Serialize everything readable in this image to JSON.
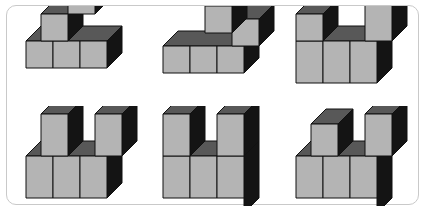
{
  "page": {
    "background_color": "#ffffff",
    "frame": {
      "border_color": "#c9c9c9",
      "corner_radius": "10px",
      "label": "puzzle-frame"
    }
  },
  "palette": {
    "cube_front": "#b4b4b4",
    "cube_top": "#585858",
    "cube_side": "#141414",
    "cube_edge": "#6e6e6e",
    "cube_top_edge": "#2a2a2a",
    "outline": "#111111"
  },
  "projection": {
    "type": "cabinet-oblique",
    "cube_face_px": 27,
    "depth_dx_px": 15,
    "depth_dy_px": -15
  },
  "figures": [
    {
      "id": "figure-1",
      "position": "top-left",
      "description": "Ascending three-step staircase",
      "cube_count": 6,
      "columns": [
        {
          "x": 0,
          "base_height": 1,
          "raised_cubes": 0
        },
        {
          "x": 1,
          "base_height": 1,
          "raised_cubes": 1
        },
        {
          "x": 2,
          "base_height": 1,
          "raised_cubes": 2
        }
      ],
      "cubes": [
        {
          "x": 0,
          "y": 0,
          "z": 0
        },
        {
          "x": 1,
          "y": 0,
          "z": 0
        },
        {
          "x": 2,
          "y": 0,
          "z": 0
        },
        {
          "x": 0,
          "y": 1,
          "z": 1
        },
        {
          "x": 1,
          "y": 1,
          "z": 1
        },
        {
          "x": 2,
          "y": 1,
          "z": 1
        },
        {
          "x": 1,
          "y": 2,
          "z": 1
        },
        {
          "x": 2,
          "y": 2,
          "z": 1
        }
      ]
    },
    {
      "id": "figure-2",
      "position": "top-center",
      "description": "Base row of three with two raised blocks stepping down to the right",
      "cube_count": 6,
      "cubes": [
        {
          "x": 0,
          "y": 0,
          "z": 0
        },
        {
          "x": 1,
          "y": 0,
          "z": 0
        },
        {
          "x": 2,
          "y": 0,
          "z": 0
        },
        {
          "x": 0,
          "y": 1,
          "z": 1
        },
        {
          "x": 1,
          "y": 1,
          "z": 1
        },
        {
          "x": 2,
          "y": 1,
          "z": 1
        },
        {
          "x": 1,
          "y": 2,
          "z": 1
        },
        {
          "x": 2,
          "y": 2,
          "z": 1
        }
      ]
    },
    {
      "id": "figure-3",
      "position": "top-right",
      "description": "U shape, left tower short and right tower tall, open middle",
      "cube_count": 6,
      "cubes": [
        {
          "x": 0,
          "y": 0,
          "z": 0
        },
        {
          "x": 1,
          "y": 0,
          "z": 0
        },
        {
          "x": 2,
          "y": 0,
          "z": 0
        },
        {
          "x": 0,
          "y": 1,
          "z": 0
        },
        {
          "x": 1,
          "y": 1,
          "z": 1
        },
        {
          "x": 2,
          "y": 1,
          "z": 1
        },
        {
          "x": 2,
          "y": 2,
          "z": 1
        }
      ]
    },
    {
      "id": "figure-4",
      "position": "bottom-left",
      "description": "U shape with both towers set back one depth step",
      "cube_count": 6,
      "cubes": [
        {
          "x": 0,
          "y": 0,
          "z": 0
        },
        {
          "x": 1,
          "y": 0,
          "z": 0
        },
        {
          "x": 2,
          "y": 0,
          "z": 0
        },
        {
          "x": 0,
          "y": 1,
          "z": 1
        },
        {
          "x": 1,
          "y": 1,
          "z": 1
        },
        {
          "x": 2,
          "y": 1,
          "z": 1
        }
      ]
    },
    {
      "id": "figure-5",
      "position": "bottom-center",
      "description": "U shape with both towers flush to the front face",
      "cube_count": 6,
      "cubes": [
        {
          "x": 0,
          "y": 0,
          "z": 0
        },
        {
          "x": 1,
          "y": 0,
          "z": 0
        },
        {
          "x": 2,
          "y": 0,
          "z": 0
        },
        {
          "x": 0,
          "y": 1,
          "z": 0
        },
        {
          "x": 2,
          "y": 1,
          "z": 0
        }
      ]
    },
    {
      "id": "figure-6",
      "position": "bottom-right",
      "description": "U shape, left tower set back low and right tower set back tall",
      "cube_count": 6,
      "cubes": [
        {
          "x": 0,
          "y": 0,
          "z": 0
        },
        {
          "x": 1,
          "y": 0,
          "z": 0
        },
        {
          "x": 2,
          "y": 0,
          "z": 0
        },
        {
          "x": 0,
          "y": 1,
          "z": 1
        },
        {
          "x": 2,
          "y": 1,
          "z": 1
        }
      ]
    }
  ]
}
